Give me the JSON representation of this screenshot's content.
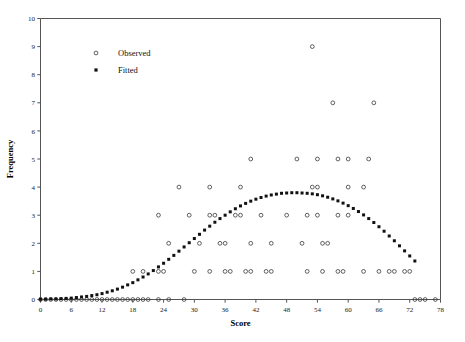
{
  "chart_data": {
    "type": "scatter",
    "title": "",
    "xlabel": "Score",
    "ylabel": "Frequency",
    "xlim": [
      0,
      78
    ],
    "ylim": [
      0,
      10
    ],
    "xticks": [
      0,
      6,
      12,
      18,
      24,
      30,
      36,
      42,
      48,
      54,
      60,
      66,
      72,
      78
    ],
    "yticks": [
      0,
      1,
      2,
      3,
      4,
      5,
      6,
      7,
      8,
      9,
      10
    ],
    "grid": false,
    "legend_position": "top-left",
    "series": [
      {
        "name": "Observed",
        "marker": "open-circle",
        "color": "#3a3a3a",
        "points": [
          [
            0,
            0
          ],
          [
            1,
            0
          ],
          [
            2,
            0
          ],
          [
            3,
            0
          ],
          [
            4,
            0
          ],
          [
            5,
            0
          ],
          [
            6,
            0
          ],
          [
            7,
            0
          ],
          [
            8,
            0
          ],
          [
            9,
            0
          ],
          [
            10,
            0
          ],
          [
            11,
            0
          ],
          [
            12,
            0
          ],
          [
            13,
            0
          ],
          [
            14,
            0
          ],
          [
            15,
            0
          ],
          [
            16,
            0
          ],
          [
            17,
            0
          ],
          [
            18,
            0
          ],
          [
            19,
            0
          ],
          [
            20,
            0
          ],
          [
            21,
            0
          ],
          [
            23,
            0
          ],
          [
            25,
            0
          ],
          [
            28,
            0
          ],
          [
            73,
            0
          ],
          [
            74,
            0
          ],
          [
            75,
            0
          ],
          [
            77,
            0
          ],
          [
            18,
            1
          ],
          [
            20,
            1
          ],
          [
            23,
            1
          ],
          [
            24,
            1
          ],
          [
            30,
            1
          ],
          [
            33,
            1
          ],
          [
            36,
            1
          ],
          [
            37,
            1
          ],
          [
            40,
            1
          ],
          [
            41,
            1
          ],
          [
            44,
            1
          ],
          [
            45,
            1
          ],
          [
            52,
            1
          ],
          [
            55,
            1
          ],
          [
            58,
            1
          ],
          [
            59,
            1
          ],
          [
            63,
            1
          ],
          [
            66,
            1
          ],
          [
            68,
            1
          ],
          [
            69,
            1
          ],
          [
            71,
            1
          ],
          [
            72,
            1
          ],
          [
            25,
            2
          ],
          [
            31,
            2
          ],
          [
            35,
            2
          ],
          [
            36,
            2
          ],
          [
            41,
            2
          ],
          [
            45,
            2
          ],
          [
            51,
            2
          ],
          [
            55,
            2
          ],
          [
            56,
            2
          ],
          [
            23,
            3
          ],
          [
            29,
            3
          ],
          [
            33,
            3
          ],
          [
            34,
            3
          ],
          [
            38,
            3
          ],
          [
            39,
            3
          ],
          [
            43,
            3
          ],
          [
            48,
            3
          ],
          [
            52,
            3
          ],
          [
            54,
            3
          ],
          [
            58,
            3
          ],
          [
            60,
            3
          ],
          [
            27,
            4
          ],
          [
            33,
            4
          ],
          [
            39,
            4
          ],
          [
            53,
            4
          ],
          [
            54,
            4
          ],
          [
            60,
            4
          ],
          [
            63,
            4
          ],
          [
            41,
            5
          ],
          [
            50,
            5
          ],
          [
            54,
            5
          ],
          [
            58,
            5
          ],
          [
            60,
            5
          ],
          [
            64,
            5
          ],
          [
            57,
            7
          ],
          [
            65,
            7
          ],
          [
            53,
            9
          ]
        ]
      },
      {
        "name": "Fitted",
        "marker": "filled-square",
        "color": "#111111",
        "points": [
          [
            0,
            0.01
          ],
          [
            1,
            0.01
          ],
          [
            2,
            0.02
          ],
          [
            3,
            0.02
          ],
          [
            4,
            0.03
          ],
          [
            5,
            0.04
          ],
          [
            6,
            0.05
          ],
          [
            7,
            0.07
          ],
          [
            8,
            0.09
          ],
          [
            9,
            0.11
          ],
          [
            10,
            0.14
          ],
          [
            11,
            0.17
          ],
          [
            12,
            0.21
          ],
          [
            13,
            0.26
          ],
          [
            14,
            0.31
          ],
          [
            15,
            0.37
          ],
          [
            16,
            0.44
          ],
          [
            17,
            0.52
          ],
          [
            18,
            0.6
          ],
          [
            19,
            0.7
          ],
          [
            20,
            0.8
          ],
          [
            21,
            0.91
          ],
          [
            22,
            1.03
          ],
          [
            23,
            1.16
          ],
          [
            24,
            1.29
          ],
          [
            25,
            1.43
          ],
          [
            26,
            1.57
          ],
          [
            27,
            1.72
          ],
          [
            28,
            1.87
          ],
          [
            29,
            2.02
          ],
          [
            30,
            2.17
          ],
          [
            31,
            2.32
          ],
          [
            32,
            2.47
          ],
          [
            33,
            2.61
          ],
          [
            34,
            2.75
          ],
          [
            35,
            2.88
          ],
          [
            36,
            3.0
          ],
          [
            37,
            3.12
          ],
          [
            38,
            3.23
          ],
          [
            39,
            3.33
          ],
          [
            40,
            3.42
          ],
          [
            41,
            3.5
          ],
          [
            42,
            3.57
          ],
          [
            43,
            3.63
          ],
          [
            44,
            3.68
          ],
          [
            45,
            3.72
          ],
          [
            46,
            3.75
          ],
          [
            47,
            3.78
          ],
          [
            48,
            3.79
          ],
          [
            49,
            3.8
          ],
          [
            50,
            3.8
          ],
          [
            51,
            3.79
          ],
          [
            52,
            3.78
          ],
          [
            53,
            3.76
          ],
          [
            54,
            3.73
          ],
          [
            55,
            3.69
          ],
          [
            56,
            3.64
          ],
          [
            57,
            3.58
          ],
          [
            58,
            3.51
          ],
          [
            59,
            3.43
          ],
          [
            60,
            3.34
          ],
          [
            61,
            3.24
          ],
          [
            62,
            3.13
          ],
          [
            63,
            3.01
          ],
          [
            64,
            2.88
          ],
          [
            65,
            2.74
          ],
          [
            66,
            2.59
          ],
          [
            67,
            2.43
          ],
          [
            68,
            2.26
          ],
          [
            69,
            2.09
          ],
          [
            70,
            1.91
          ],
          [
            71,
            1.73
          ],
          [
            72,
            1.55
          ],
          [
            73,
            1.37
          ]
        ]
      }
    ]
  },
  "legend": {
    "items": [
      {
        "label": "Observed"
      },
      {
        "label": "Fitted"
      }
    ]
  },
  "axes": {
    "x_title": "Score",
    "y_title": "Frequency"
  }
}
